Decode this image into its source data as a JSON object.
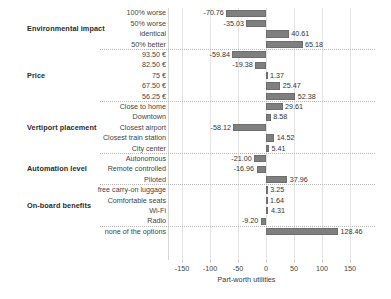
{
  "chart_data": {
    "type": "bar",
    "orientation": "horizontal",
    "title": "",
    "xlabel": "Part-worth utilities",
    "ylabel": "",
    "xlim": [
      -175,
      175
    ],
    "xticks": [
      -150,
      -100,
      -50,
      0,
      50,
      100,
      150
    ],
    "grid": true,
    "legend": null,
    "bar_color": "#7f7f7f",
    "groups": [
      {
        "name": "Environmental impact",
        "categories": [
          "100% worse",
          "50% worse",
          "identical",
          "50% better"
        ],
        "values": [
          -70.76,
          -35.03,
          40.61,
          65.18
        ],
        "labels": [
          "-70.76",
          "-35.03",
          "40.61",
          "65.18"
        ]
      },
      {
        "name": "Price",
        "categories": [
          "93.50 €",
          "82.50 €",
          "75 €",
          "67.50 €",
          "56.25 €"
        ],
        "values": [
          -59.84,
          -19.38,
          1.37,
          25.47,
          52.38
        ],
        "labels": [
          "-59.84",
          "-19.38",
          "1.37",
          "25.47",
          "52.38"
        ]
      },
      {
        "name": "Vertiport placement",
        "categories": [
          "Close to home",
          "Downtown",
          "Closest airport",
          "Closest train station",
          "City center"
        ],
        "values": [
          29.61,
          8.58,
          -58.12,
          14.52,
          5.41
        ],
        "labels": [
          "29.61",
          "8.58",
          "-58.12",
          "14.52",
          "5.41"
        ]
      },
      {
        "name": "Automation level",
        "categories": [
          "Autonomous",
          "Remote controlled",
          "Piloted"
        ],
        "values": [
          -21.0,
          -16.96,
          37.96
        ],
        "labels": [
          "-21.00",
          "-16.96",
          "37.96"
        ]
      },
      {
        "name": "On-board benefits",
        "categories": [
          "free carry-on luggage",
          "Comfortable seats",
          "Wi-Fi",
          "Radio"
        ],
        "values": [
          3.25,
          1.64,
          4.31,
          -9.2
        ],
        "labels": [
          "3.25",
          "1.64",
          "4.31",
          "-9.20"
        ]
      },
      {
        "name": "",
        "categories": [
          "none of the options"
        ],
        "values": [
          128.46
        ],
        "labels": [
          "128.46"
        ]
      }
    ]
  }
}
